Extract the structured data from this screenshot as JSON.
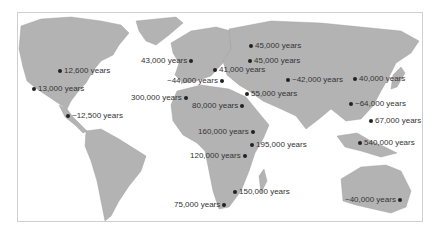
{
  "map": {
    "title": "Human migration dates",
    "colors": {
      "land": "#b3b3b3",
      "ocean": "#ffffff",
      "marker": "#222222",
      "text": "#333333"
    },
    "sites": [
      {
        "label": "12,600 years",
        "x": 56,
        "y": 70,
        "dot": "left"
      },
      {
        "label": "13,000 years",
        "x": 30,
        "y": 88,
        "dot": "left"
      },
      {
        "label": "~12,500 years",
        "x": 67,
        "y": 115,
        "dot": "left"
      },
      {
        "label": "43,000 years",
        "x": 143,
        "y": 60,
        "dot": "right"
      },
      {
        "label": "41,000 years",
        "x": 213,
        "y": 69,
        "dot": "left"
      },
      {
        "label": "~44,000 years",
        "x": 168,
        "y": 80,
        "dot": "right"
      },
      {
        "label": "45,000 years",
        "x": 249,
        "y": 45,
        "dot": "left"
      },
      {
        "label": "45,000 years",
        "x": 248,
        "y": 60,
        "dot": "left"
      },
      {
        "label": "~42,000 years",
        "x": 286,
        "y": 79,
        "dot": "left"
      },
      {
        "label": "40,000 years",
        "x": 353,
        "y": 78,
        "dot": "left"
      },
      {
        "label": "300,000 years",
        "x": 131,
        "y": 97,
        "dot": "right"
      },
      {
        "label": "80,000 years",
        "x": 193,
        "y": 105,
        "dot": "right"
      },
      {
        "label": "55,000 years",
        "x": 245,
        "y": 93,
        "dot": "left"
      },
      {
        "label": "~64,000 years",
        "x": 349,
        "y": 103,
        "dot": "left"
      },
      {
        "label": "67,000 years",
        "x": 369,
        "y": 120,
        "dot": "left"
      },
      {
        "label": "160,000 years",
        "x": 200,
        "y": 131,
        "dot": "right"
      },
      {
        "label": "195,000 years",
        "x": 250,
        "y": 144,
        "dot": "left"
      },
      {
        "label": "120,000 years",
        "x": 192,
        "y": 155,
        "dot": "right"
      },
      {
        "label": "540,000 years",
        "x": 358,
        "y": 142,
        "dot": "left"
      },
      {
        "label": "150,000 years",
        "x": 233,
        "y": 191,
        "dot": "left"
      },
      {
        "label": "75,000 years",
        "x": 174,
        "y": 204,
        "dot": "right"
      },
      {
        "label": "~40,000 years",
        "x": 346,
        "y": 199,
        "dot": "right"
      }
    ]
  }
}
